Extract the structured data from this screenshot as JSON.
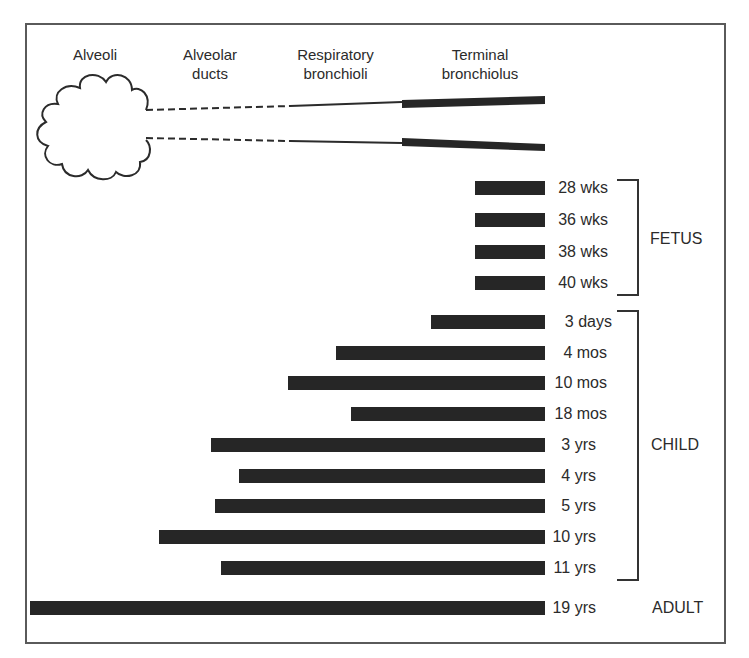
{
  "headers": {
    "alveoli": "Alveoli",
    "alveolar_ducts_1": "Alveolar",
    "alveolar_ducts_2": "ducts",
    "respiratory_1": "Respiratory",
    "respiratory_2": "bronchioli",
    "terminal_1": "Terminal",
    "terminal_2": "bronchiolus"
  },
  "rows": [
    {
      "label": "28 wks",
      "start": 475,
      "y": 188
    },
    {
      "label": "36 wks",
      "start": 475,
      "y": 220
    },
    {
      "label": "38 wks",
      "start": 475,
      "y": 252
    },
    {
      "label": "40 wks",
      "start": 475,
      "y": 283
    },
    {
      "label": "3 days",
      "start": 431,
      "y": 322
    },
    {
      "label": "4 mos",
      "start": 336,
      "y": 353
    },
    {
      "label": "10 mos",
      "start": 288,
      "y": 383
    },
    {
      "label": "18 mos",
      "start": 351,
      "y": 414
    },
    {
      "label": "3 yrs",
      "start": 211,
      "y": 445
    },
    {
      "label": "4 yrs",
      "start": 239,
      "y": 476
    },
    {
      "label": "5 yrs",
      "start": 215,
      "y": 506
    },
    {
      "label": "10 yrs",
      "start": 159,
      "y": 537
    },
    {
      "label": "11 yrs",
      "start": 221,
      "y": 568
    },
    {
      "label": "19 yrs",
      "start": 30,
      "y": 608
    }
  ],
  "groups": {
    "fetus": "FETUS",
    "child": "CHILD",
    "adult": "ADULT"
  },
  "colors": {
    "bar": "#262626",
    "frame": "#5a5a5a",
    "text": "#2b2b2b"
  }
}
